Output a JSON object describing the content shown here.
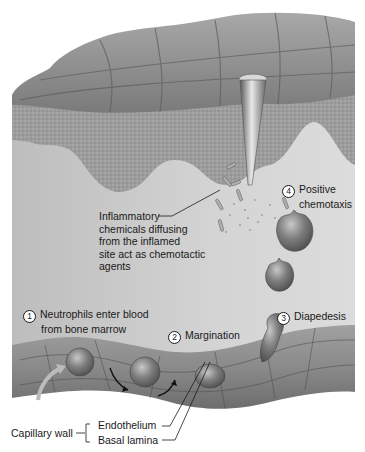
{
  "diagram": {
    "labels": {
      "inflammatory": [
        "Inflammatory",
        "chemicals diffusing",
        "from the inflamed",
        "site act as chemotactic",
        "agents"
      ],
      "step1": {
        "num": "1",
        "lines": [
          "Neutrophils enter blood",
          "from bone marrow"
        ]
      },
      "step2": {
        "num": "2",
        "text": "Margination"
      },
      "step3": {
        "num": "3",
        "text": "Diapedesis"
      },
      "step4": {
        "num": "4",
        "lines": [
          "Positive",
          "chemotaxis"
        ]
      },
      "capillary_wall": "Capillary wall",
      "endothelium": "Endothelium",
      "basal_lamina": "Basal lamina"
    },
    "colors": {
      "epidermis": "#8f8f8f",
      "dermis": "#c9c9c9",
      "capillary": "#8a8a8a",
      "cell": "#6e6e6e",
      "text": "#1a1a1a"
    }
  }
}
